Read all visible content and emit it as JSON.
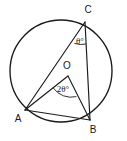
{
  "diagram": {
    "type": "circle-geometry",
    "background_color": "#ffffff",
    "stroke_color": "#1a1a1a",
    "circle": {
      "label": "circle",
      "center_x": 61,
      "center_y": 71,
      "radius": 51
    },
    "points": [
      {
        "id": "A",
        "label": "A",
        "x": 25,
        "y": 110,
        "label_x": 18,
        "label_y": 119
      },
      {
        "id": "B",
        "label": "B",
        "x": 90,
        "y": 120,
        "label_x": 93,
        "label_y": 130
      },
      {
        "id": "C",
        "label": "C",
        "x": 85,
        "y": 22,
        "label_x": 88,
        "label_y": 10
      },
      {
        "id": "O",
        "label": "O",
        "x": 68,
        "y": 76,
        "label_x": 67,
        "label_y": 66
      }
    ],
    "segments": [
      {
        "name": "chord-CA",
        "from": "C",
        "to": "A",
        "x1": 85,
        "y1": 22,
        "x2": 25,
        "y2": 110
      },
      {
        "name": "chord-CB",
        "from": "C",
        "to": "B",
        "x1": 85,
        "y1": 22,
        "x2": 90,
        "y2": 120
      },
      {
        "name": "chord-AB",
        "from": "A",
        "to": "B",
        "x1": 25,
        "y1": 110,
        "x2": 90,
        "y2": 120
      },
      {
        "name": "radius-OA",
        "from": "O",
        "to": "A",
        "x1": 68,
        "y1": 76,
        "x2": 25,
        "y2": 110
      },
      {
        "name": "radius-OB",
        "from": "O",
        "to": "B",
        "x1": 68,
        "y1": 76,
        "x2": 90,
        "y2": 120
      }
    ],
    "angles": [
      {
        "name": "inscribed-angle-at-C",
        "vertex": "C",
        "label": "θ°",
        "label_x": 80,
        "label_y": 42,
        "arc_path": "M 74.4 43.4 A 22 22 0 0 0 86.1 44.0"
      },
      {
        "name": "central-angle-at-O",
        "vertex": "O",
        "label": "2θ°",
        "label_x": 63,
        "label_y": 90,
        "arc_path": "M 53.2 87.9 A 22 22 0 0 0 76.4 96.6"
      }
    ]
  }
}
